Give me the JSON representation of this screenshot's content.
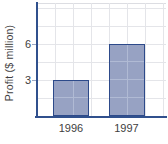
{
  "chart_data": {
    "type": "bar",
    "title": "",
    "ylabel": "Profit ($ million)",
    "xlabel": "",
    "categories": [
      "1996",
      "1997"
    ],
    "values": [
      3,
      6
    ],
    "yticks": [
      3,
      6
    ],
    "ylim": [
      0,
      9.4
    ],
    "grid_step": 1.5,
    "grid": "on",
    "legend_position": "none"
  },
  "colors": {
    "bar_fill": "#97a2c3",
    "bar_border": "#2d4a8a",
    "bar_gridline_overlay": "#b0bad4",
    "axis": "#30508d",
    "gridline": "#e4e5e9",
    "text": "#3e3e40"
  }
}
